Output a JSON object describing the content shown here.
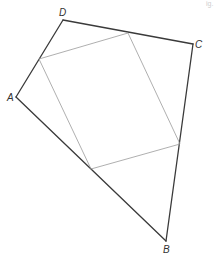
{
  "diagram": {
    "type": "quadrilateral-with-midpoint-parallelogram",
    "labels": {
      "A": "A",
      "B": "B",
      "C": "C",
      "D": "D"
    },
    "corner_mark": "ig.",
    "vertices": {
      "A": [
        16,
        97
      ],
      "B": [
        166,
        241
      ],
      "C": [
        193,
        44
      ],
      "D": [
        63,
        20
      ]
    },
    "midpoints": {
      "DC": [
        128,
        33
      ],
      "DA": [
        39,
        59
      ],
      "AB": [
        91,
        169
      ],
      "CB": [
        180,
        144
      ]
    },
    "colors": {
      "outer": "#3a3a3a",
      "inner": "#9a9a9a",
      "label": "#333333",
      "background": "#ffffff"
    }
  }
}
